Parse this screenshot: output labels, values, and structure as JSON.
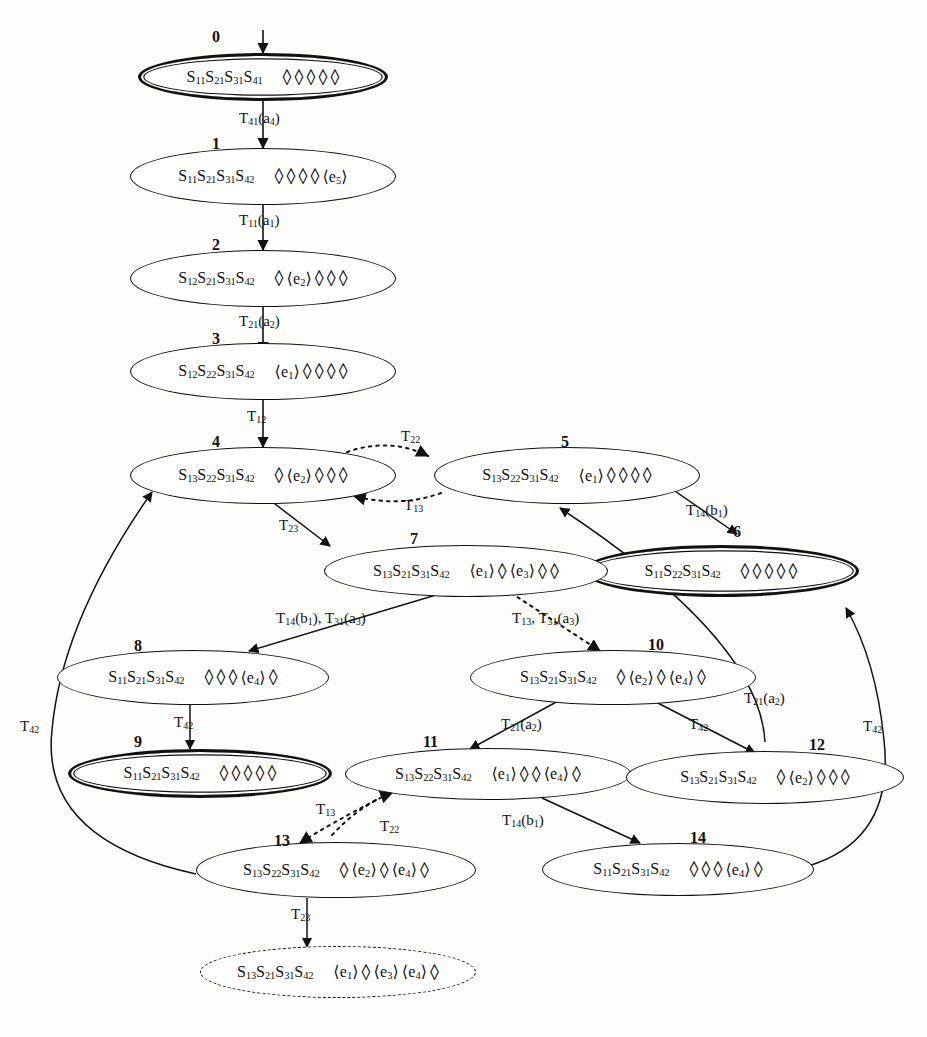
{
  "diagram": {
    "nodes": [
      {
        "id": "0",
        "state": "S11S21S31S41",
        "slots": [
          "<>",
          "<>",
          "<>",
          "<>",
          "<>"
        ],
        "style": "double"
      },
      {
        "id": "1",
        "state": "S11S21S31S42",
        "slots": [
          "<>",
          "<>",
          "<>",
          "<>",
          "e5"
        ],
        "style": "single"
      },
      {
        "id": "2",
        "state": "S12S21S31S42",
        "slots": [
          "<>",
          "e2",
          "<>",
          "<>",
          "<>"
        ],
        "style": "single"
      },
      {
        "id": "3",
        "state": "S12S22S31S42",
        "slots": [
          "e1",
          "<>",
          "<>",
          "<>",
          "<>"
        ],
        "style": "single"
      },
      {
        "id": "4",
        "state": "S13S22S31S42",
        "slots": [
          "<>",
          "e2",
          "<>",
          "<>",
          "<>"
        ],
        "style": "single"
      },
      {
        "id": "5",
        "state": "S13S22S31S42",
        "slots": [
          "e1",
          "<>",
          "<>",
          "<>",
          "<>"
        ],
        "style": "single"
      },
      {
        "id": "6",
        "state": "S11S22S31S42",
        "slots": [
          "<>",
          "<>",
          "<>",
          "<>",
          "<>"
        ],
        "style": "double"
      },
      {
        "id": "7",
        "state": "S13S21S31S42",
        "slots": [
          "e1",
          "<>",
          "e3",
          "<>",
          "<>"
        ],
        "style": "single"
      },
      {
        "id": "8",
        "state": "S11S21S31S42",
        "slots": [
          "<>",
          "<>",
          "<>",
          "e4",
          "<>"
        ],
        "style": "single"
      },
      {
        "id": "9",
        "state": "S11S21S31S42",
        "slots": [
          "<>",
          "<>",
          "<>",
          "<>",
          "<>"
        ],
        "style": "double"
      },
      {
        "id": "10",
        "state": "S13S21S31S42",
        "slots": [
          "<>",
          "e2",
          "<>",
          "e4",
          "<>"
        ],
        "style": "single"
      },
      {
        "id": "11",
        "state": "S13S22S31S42",
        "slots": [
          "e1",
          "<>",
          "<>",
          "e4",
          "<>"
        ],
        "style": "single"
      },
      {
        "id": "12",
        "state": "S13S21S31S42",
        "slots": [
          "<>",
          "e2",
          "<>",
          "<>",
          "<>"
        ],
        "style": "single"
      },
      {
        "id": "13",
        "state": "S13S22S31S42",
        "slots": [
          "<>",
          "e2",
          "<>",
          "e4",
          "<>"
        ],
        "style": "single"
      },
      {
        "id": "14",
        "state": "S11S21S31S42",
        "slots": [
          "<>",
          "<>",
          "<>",
          "e4",
          "<>"
        ],
        "style": "single"
      },
      {
        "id": "",
        "state": "S13S21S31S42",
        "slots": [
          "e1",
          "<>",
          "e3",
          "e4",
          "<>"
        ],
        "style": "dashed"
      }
    ],
    "edge_labels": [
      {
        "key": "e_0_1",
        "text": "T41(a4)"
      },
      {
        "key": "e_1_2",
        "text": "T11(a1)"
      },
      {
        "key": "e_2_3",
        "text": "T21(a2)"
      },
      {
        "key": "e_3_4",
        "text": "T12"
      },
      {
        "key": "e_4_5",
        "text": "T22"
      },
      {
        "key": "e_5_4",
        "text": "T13"
      },
      {
        "key": "e_4_7",
        "text": "T23"
      },
      {
        "key": "e_5_6",
        "text": "T14(b1)"
      },
      {
        "key": "e_7_8",
        "text": "T14(b1), T31(a3)"
      },
      {
        "key": "e_7_10",
        "text": "T13, T31(a3)"
      },
      {
        "key": "e_8_9",
        "text": "T42"
      },
      {
        "key": "e_10_11",
        "text": "T21(a2)"
      },
      {
        "key": "e_10_12",
        "text": "T42"
      },
      {
        "key": "e_12_5",
        "text": "T21(a2)"
      },
      {
        "key": "e_13_4",
        "text": "T42"
      },
      {
        "key": "e_14_6",
        "text": "T42"
      },
      {
        "key": "e_11_13",
        "text": "T22"
      },
      {
        "key": "e_13_11",
        "text": "T13"
      },
      {
        "key": "e_11_14",
        "text": "T14(b1)"
      },
      {
        "key": "e_13_15",
        "text": "T23"
      }
    ]
  }
}
